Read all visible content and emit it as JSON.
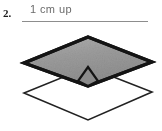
{
  "question": {
    "number": "2.",
    "answer_text": "1 cm up"
  },
  "figure": {
    "caption_alt": "two overlapping rhombi, upper one shaded",
    "colors": {
      "page_background": "#ffffff",
      "shaded_fill": "#9a9a9a",
      "shaded_fill_light": "#b4b4b4",
      "outline_dark": "#141414",
      "outline_thin": "#222222",
      "rule_gray": "#8d8d8d",
      "text_gray": "#6b6b6b",
      "number_black": "#1b1b1b"
    },
    "shaded_rhombus": {
      "name": "shaded-rhombus",
      "points": "88,13 152,38 88,62 24,39",
      "stroke_width": 3.2
    },
    "open_rhombus": {
      "name": "open-rhombus",
      "points": "88,43 152,68 88,96 24,69",
      "stroke_width": 1.6
    },
    "overlap_region": {
      "name": "overlap-lens",
      "points": "88,43 98,57 88,62 78,57"
    }
  }
}
